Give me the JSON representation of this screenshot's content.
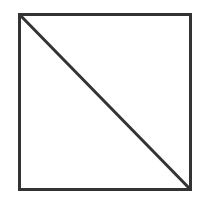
{
  "diagram": {
    "shape": "square-with-diagonal",
    "stroke_color": "#333333",
    "background_color": "#ffffff",
    "stroke_width": 3,
    "square": {
      "x": 19,
      "y": 14,
      "width": 172,
      "height": 176
    },
    "diagonal": {
      "from": "top-left",
      "to": "bottom-right"
    }
  }
}
